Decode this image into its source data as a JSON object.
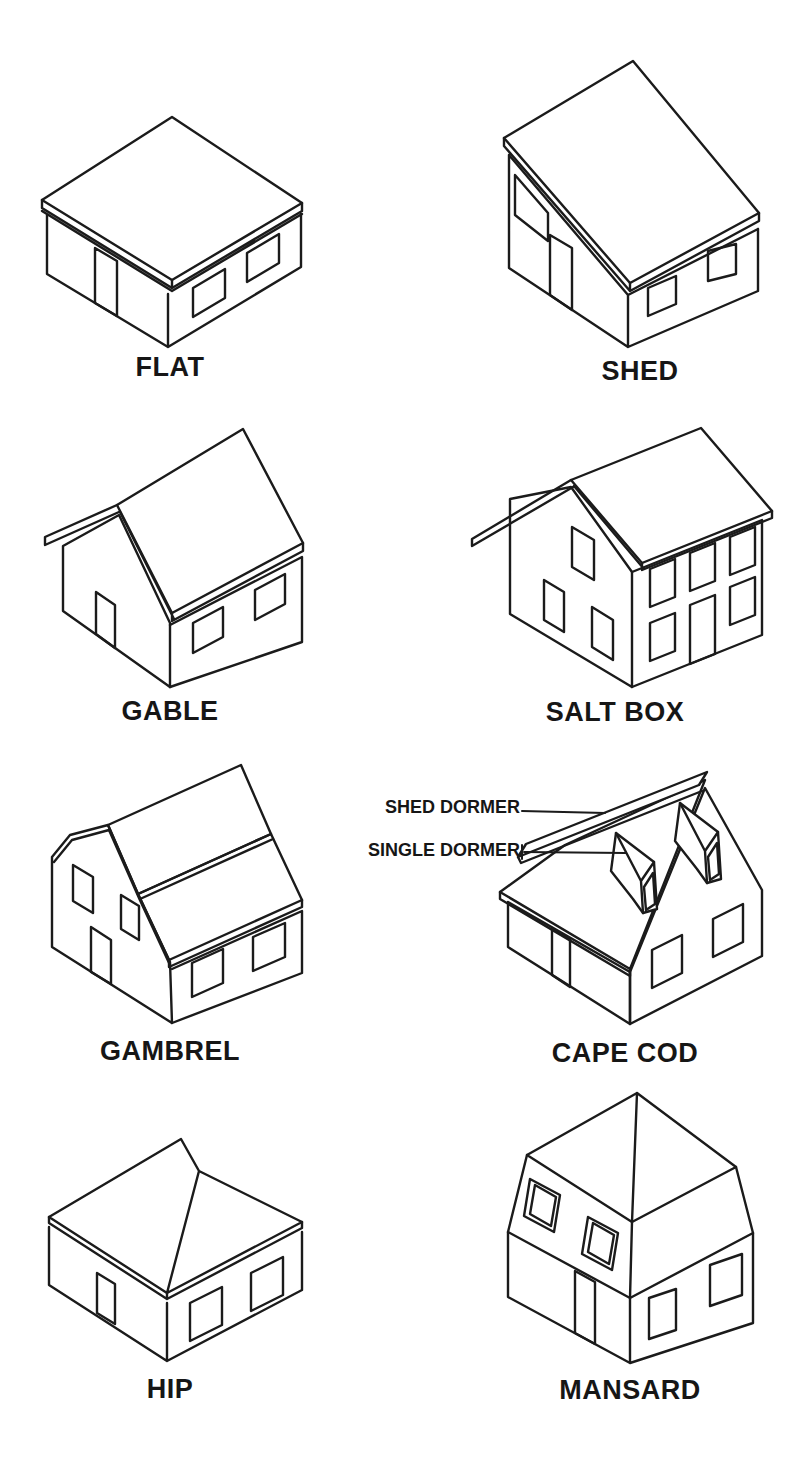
{
  "page": {
    "background": "#ffffff",
    "ink": "#1b1b1b"
  },
  "diagram": {
    "roof_types": [
      {
        "label": "FLAT"
      },
      {
        "label": "SHED"
      },
      {
        "label": "GABLE"
      },
      {
        "label": "SALT BOX"
      },
      {
        "label": "GAMBREL"
      },
      {
        "label": "CAPE COD"
      },
      {
        "label": "HIP"
      },
      {
        "label": "MANSARD"
      }
    ],
    "cape_cod_annotations": {
      "shed_dormer_label": "SHED DORMER",
      "single_dormer_label": "SINGLE DORMER"
    }
  }
}
